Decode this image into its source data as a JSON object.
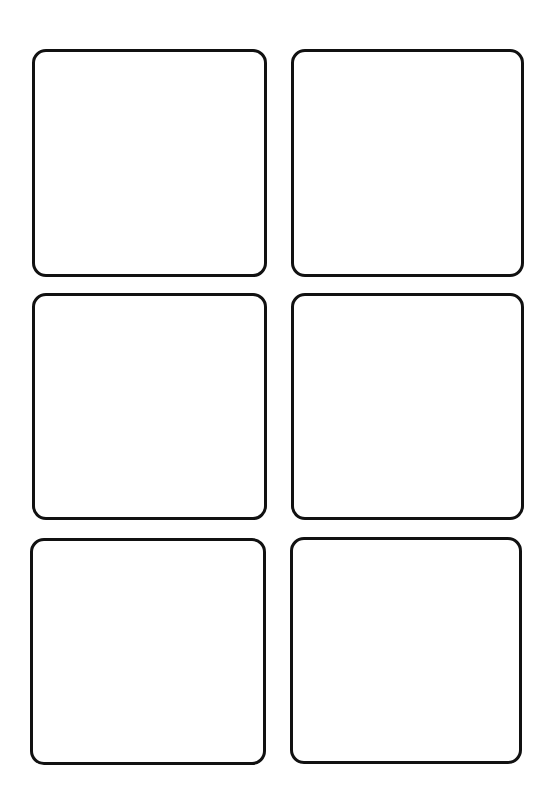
{
  "page": {
    "background": "#ffffff",
    "border_color": "#111111",
    "layout": "3 rows x 2 columns of blank rounded rectangles"
  },
  "cards": [
    {
      "id": "card-1",
      "row": 1,
      "col": 1,
      "x": 32,
      "y": 49,
      "w": 235,
      "h": 228
    },
    {
      "id": "card-2",
      "row": 1,
      "col": 2,
      "x": 291,
      "y": 49,
      "w": 233,
      "h": 228
    },
    {
      "id": "card-3",
      "row": 2,
      "col": 1,
      "x": 32,
      "y": 293,
      "w": 235,
      "h": 227
    },
    {
      "id": "card-4",
      "row": 2,
      "col": 2,
      "x": 291,
      "y": 293,
      "w": 233,
      "h": 227
    },
    {
      "id": "card-5",
      "row": 3,
      "col": 1,
      "x": 30,
      "y": 538,
      "w": 236,
      "h": 227
    },
    {
      "id": "card-6",
      "row": 3,
      "col": 2,
      "x": 290,
      "y": 537,
      "w": 232,
      "h": 227
    }
  ]
}
